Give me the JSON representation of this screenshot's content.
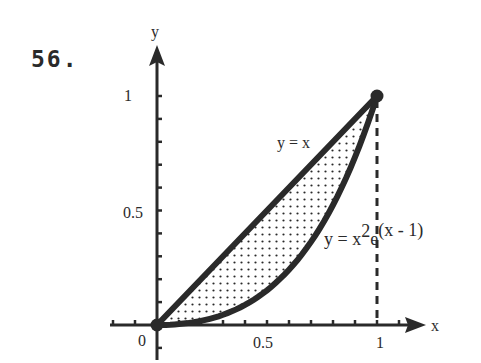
{
  "problem": {
    "number": "56."
  },
  "chart_data": {
    "type": "area",
    "title": "",
    "xlabel": "x",
    "ylabel": "y",
    "xlim": [
      0,
      1.2
    ],
    "ylim": [
      0,
      1.2
    ],
    "x_ticks": [
      {
        "value": 0,
        "label": "0"
      },
      {
        "value": 0.5,
        "label": "0.5"
      },
      {
        "value": 1,
        "label": "1"
      }
    ],
    "y_ticks": [
      {
        "value": 0.5,
        "label": "0.5"
      },
      {
        "value": 1,
        "label": "1"
      }
    ],
    "minor_tick_step": 0.1,
    "grid": false,
    "series": [
      {
        "name": "y = x",
        "label": "y = x",
        "function": "x",
        "x": [
          0,
          0.25,
          0.5,
          0.75,
          1
        ],
        "y": [
          0,
          0.25,
          0.5,
          0.75,
          1
        ]
      },
      {
        "name": "y = x^2 e^(x-1)",
        "label_main": "y = x",
        "label_exp": "2",
        "label_tail": "e",
        "label_sup": "(x - 1)",
        "function": "x^2*exp(x-1)",
        "x": [
          0,
          0.25,
          0.5,
          0.75,
          1
        ],
        "y": [
          0,
          0.0295,
          0.1516,
          0.438,
          1
        ]
      }
    ],
    "shaded_region": {
      "between": [
        "y = x",
        "y = x^2 e^(x-1)"
      ],
      "x_range": [
        0,
        1
      ],
      "pattern": "dots"
    },
    "points": [
      {
        "x": 0,
        "y": 0
      },
      {
        "x": 1,
        "y": 1
      }
    ],
    "reference_lines": [
      {
        "type": "vertical",
        "x": 1,
        "style": "dashed"
      }
    ]
  },
  "colors": {
    "ink": "#2a2a2a",
    "background": "#ffffff"
  }
}
